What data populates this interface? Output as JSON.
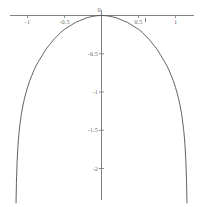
{
  "figure": {
    "background_color": "#ffffff",
    "axis_color": "#737373",
    "curve_color": "#5a5a5a",
    "label_color": "#6d6d6d"
  },
  "chart_data": {
    "type": "line",
    "title": "",
    "subtitle": "",
    "xlabel": "",
    "ylabel": "",
    "grid": false,
    "legend": null,
    "axis_style": "centered-cross",
    "xlim": [
      -1.22,
      1.22
    ],
    "ylim": [
      -2.45,
      0.12
    ],
    "x_ticks": [
      -1,
      -0.5,
      0,
      0.5,
      1
    ],
    "x_tick_labels": [
      "-1",
      "-0.5",
      "0",
      "0.5",
      "1"
    ],
    "y_ticks": [
      -0.5,
      -1,
      -1.5,
      -2
    ],
    "y_tick_labels": [
      "-0.5",
      "-1",
      "-1.5",
      "-2"
    ],
    "annotations": [
      {
        "name": "curve-tick-mark",
        "x": 0.595,
        "y": -0.06,
        "label": ""
      }
    ],
    "series": [
      {
        "name": "curve",
        "function": "log(cos(x))",
        "x": [
          -1.155,
          -1.15,
          -1.14,
          -1.13,
          -1.12,
          -1.11,
          -1.1,
          -1.08,
          -1.06,
          -1.04,
          -1.02,
          -1.0,
          -0.97,
          -0.94,
          -0.91,
          -0.88,
          -0.85,
          -0.8,
          -0.75,
          -0.7,
          -0.65,
          -0.6,
          -0.55,
          -0.5,
          -0.45,
          -0.4,
          -0.35,
          -0.3,
          -0.25,
          -0.2,
          -0.15,
          -0.1,
          -0.05,
          0.0,
          0.05,
          0.1,
          0.15,
          0.2,
          0.25,
          0.3,
          0.35,
          0.4,
          0.45,
          0.5,
          0.55,
          0.6,
          0.65,
          0.7,
          0.75,
          0.8,
          0.85,
          0.88,
          0.91,
          0.94,
          0.97,
          1.0,
          1.02,
          1.04,
          1.06,
          1.08,
          1.1,
          1.11,
          1.12,
          1.13,
          1.14,
          1.15,
          1.155
        ],
        "y": [
          -2.45,
          -2.2,
          -1.9,
          -1.72,
          -1.59,
          -1.49,
          -1.41,
          -1.27,
          -1.17,
          -1.08,
          -1.01,
          -0.94,
          -0.85,
          -0.78,
          -0.71,
          -0.65,
          -0.6,
          -0.52,
          -0.44,
          -0.38,
          -0.32,
          -0.27,
          -0.22,
          -0.18,
          -0.15,
          -0.12,
          -0.09,
          -0.07,
          -0.05,
          -0.03,
          -0.018,
          -0.008,
          -0.002,
          0.0,
          -0.002,
          -0.008,
          -0.018,
          -0.03,
          -0.05,
          -0.07,
          -0.09,
          -0.12,
          -0.15,
          -0.18,
          -0.22,
          -0.27,
          -0.32,
          -0.38,
          -0.44,
          -0.52,
          -0.6,
          -0.65,
          -0.71,
          -0.78,
          -0.85,
          -0.94,
          -1.01,
          -1.08,
          -1.17,
          -1.27,
          -1.41,
          -1.49,
          -1.59,
          -1.72,
          -1.9,
          -2.2,
          -2.45
        ]
      }
    ]
  }
}
